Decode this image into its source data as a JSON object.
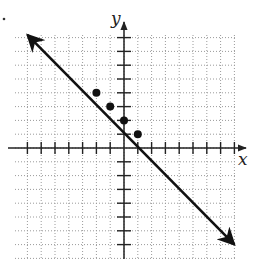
{
  "chart_data": {
    "type": "line",
    "title": "",
    "xlabel": "x",
    "ylabel": "y",
    "xlim": [
      -8,
      8
    ],
    "ylim": [
      -8,
      8
    ],
    "grid": true,
    "grid_style": "dotted",
    "equation": "y = -x + 2",
    "series": [
      {
        "name": "line",
        "x": [
          -7,
          8
        ],
        "y": [
          8.2,
          -7
        ],
        "arrows_both_ends": true
      }
    ],
    "points": [
      {
        "x": -2,
        "y": 4
      },
      {
        "x": -1,
        "y": 3
      },
      {
        "x": 0,
        "y": 2
      },
      {
        "x": 1,
        "y": 1
      }
    ]
  },
  "labels": {
    "x_axis": "x",
    "y_axis": "y"
  },
  "colors": {
    "line": "#111111",
    "grid": "#9a9a9a",
    "axis": "#222222"
  }
}
